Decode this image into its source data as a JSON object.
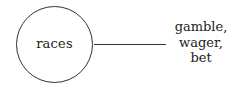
{
  "diagram": {
    "node": {
      "label": "races",
      "shape": "circle"
    },
    "edge": {
      "from": "races",
      "to": "synonyms"
    },
    "target": {
      "lines": [
        "gamble,",
        "wager,",
        "bet"
      ]
    }
  }
}
